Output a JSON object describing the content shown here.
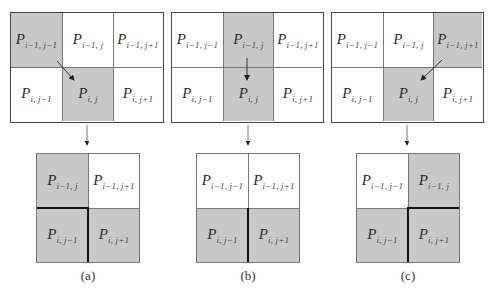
{
  "colors": {
    "shaded": "#c8c8c8",
    "unshaded": "#ffffff",
    "border": "#444444",
    "emphasis_line": "#111111"
  },
  "panels": [
    {
      "caption": "(a)",
      "top_grid": {
        "cells": [
          {
            "name": "P",
            "sub": "i−1, j−1",
            "shaded": true
          },
          {
            "name": "P",
            "sub": "i−1, j",
            "shaded": false
          },
          {
            "name": "P",
            "sub": "i−1, j+1",
            "shaded": false
          },
          {
            "name": "P",
            "sub": "i, j−1",
            "shaded": false
          },
          {
            "name": "P",
            "sub": "i, j",
            "shaded": true
          },
          {
            "name": "P",
            "sub": "i, j+1",
            "shaded": false
          }
        ],
        "arrow": "from P(i−1,j−1) to P(i,j)"
      },
      "bottom_grid": {
        "cells": [
          {
            "name": "P",
            "sub": "i−1, j",
            "shaded": true
          },
          {
            "name": "P",
            "sub": "i−1, j+1",
            "shaded": false
          },
          {
            "name": "P",
            "sub": "i, j−1",
            "shaded": true
          },
          {
            "name": "P",
            "sub": "i, j+1",
            "shaded": true
          }
        ],
        "emphasis": "thick lines: left-center horizontal + lower vertical"
      }
    },
    {
      "caption": "(b)",
      "top_grid": {
        "cells": [
          {
            "name": "P",
            "sub": "i−1, j−1",
            "shaded": false
          },
          {
            "name": "P",
            "sub": "i−1, j",
            "shaded": true
          },
          {
            "name": "P",
            "sub": "i−1, j+1",
            "shaded": false
          },
          {
            "name": "P",
            "sub": "i, j−1",
            "shaded": false
          },
          {
            "name": "P",
            "sub": "i, j",
            "shaded": true
          },
          {
            "name": "P",
            "sub": "i, j+1",
            "shaded": false
          }
        ],
        "arrow": "from P(i−1,j) to P(i,j)"
      },
      "bottom_grid": {
        "cells": [
          {
            "name": "P",
            "sub": "i−1, j−1",
            "shaded": false
          },
          {
            "name": "P",
            "sub": "i−1, j+1",
            "shaded": false
          },
          {
            "name": "P",
            "sub": "i, j−1",
            "shaded": true
          },
          {
            "name": "P",
            "sub": "i, j+1",
            "shaded": true
          }
        ],
        "emphasis": "thick line: lower vertical"
      }
    },
    {
      "caption": "(c)",
      "top_grid": {
        "cells": [
          {
            "name": "P",
            "sub": "i−1, j−1",
            "shaded": false
          },
          {
            "name": "P",
            "sub": "i−1, j",
            "shaded": false
          },
          {
            "name": "P",
            "sub": "i−1, j+1",
            "shaded": true
          },
          {
            "name": "P",
            "sub": "i, j−1",
            "shaded": false
          },
          {
            "name": "P",
            "sub": "i, j",
            "shaded": true
          },
          {
            "name": "P",
            "sub": "i, j+1",
            "shaded": false
          }
        ],
        "arrow": "from P(i−1,j+1) to P(i,j)"
      },
      "bottom_grid": {
        "cells": [
          {
            "name": "P",
            "sub": "i−1, j−1",
            "shaded": false
          },
          {
            "name": "P",
            "sub": "i−1, j",
            "shaded": true
          },
          {
            "name": "P",
            "sub": "i, j−1",
            "shaded": true
          },
          {
            "name": "P",
            "sub": "i, j+1",
            "shaded": true
          }
        ],
        "emphasis": "thick lines: right-center horizontal + lower vertical"
      }
    }
  ]
}
